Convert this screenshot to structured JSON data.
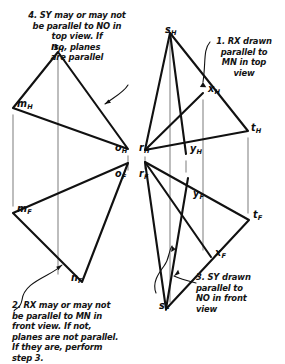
{
  "drawing": {
    "title": "Descriptive geometry construction: parallel planes MNO and RST",
    "ink_color": "#111111",
    "projection_line_color": "#9a9a9a",
    "background_color": "#ffffff"
  },
  "notes": [
    {
      "id": "note-1",
      "number": "1.",
      "text": "1. RX drawn\nparallel to\nMN in top\nview"
    },
    {
      "id": "note-2",
      "number": "2.",
      "text": "2. RX may or may not\n   be parallel to MN in\n   front view. If not,\n   planes are not parallel.\n   If they are, perform\n   step  3."
    },
    {
      "id": "note-3",
      "number": "3.",
      "text": "3. SY drawn\n    parallel to\n    NO in front\n    view"
    },
    {
      "id": "note-4",
      "number": "4.",
      "text": "4. SY may or may not\nbe parallel to NO in\ntop view. If\nso, planes\nare parallel"
    }
  ],
  "point_labels": [
    {
      "id": "m-h",
      "base": "m",
      "sub": "H",
      "x": 17,
      "y": 98
    },
    {
      "id": "n-h",
      "base": "n",
      "sub": "H",
      "x": 51,
      "y": 41
    },
    {
      "id": "o-h",
      "base": "o",
      "sub": "H",
      "x": 115,
      "y": 142
    },
    {
      "id": "r-h",
      "base": "r",
      "sub": "H",
      "x": 139,
      "y": 142
    },
    {
      "id": "s-h",
      "base": "s",
      "sub": "H",
      "x": 165,
      "y": 24
    },
    {
      "id": "x-h",
      "base": "x",
      "sub": "H",
      "x": 208,
      "y": 83
    },
    {
      "id": "y-h",
      "base": "y",
      "sub": "H",
      "x": 190,
      "y": 143
    },
    {
      "id": "t-h",
      "base": "t",
      "sub": "H",
      "x": 251,
      "y": 122
    },
    {
      "id": "m-f",
      "base": "m",
      "sub": "F",
      "x": 17,
      "y": 203
    },
    {
      "id": "n-f",
      "base": "n",
      "sub": "F",
      "x": 71,
      "y": 272
    },
    {
      "id": "o-f",
      "base": "o",
      "sub": "F",
      "x": 115,
      "y": 168
    },
    {
      "id": "r-f",
      "base": "r",
      "sub": "F",
      "x": 139,
      "y": 168
    },
    {
      "id": "s-f",
      "base": "s",
      "sub": "F",
      "x": 159,
      "y": 300
    },
    {
      "id": "x-f",
      "base": "x",
      "sub": "F",
      "x": 215,
      "y": 247
    },
    {
      "id": "y-f",
      "base": "y",
      "sub": "F",
      "x": 193,
      "y": 188
    },
    {
      "id": "t-f",
      "base": "t",
      "sub": "F",
      "x": 253,
      "y": 209
    }
  ],
  "geometry": {
    "points": {
      "m_H": [
        13,
        108
      ],
      "n_H": [
        58,
        52
      ],
      "o_H": [
        128,
        149
      ],
      "r_H": [
        145,
        150
      ],
      "s_H": [
        170,
        33
      ],
      "t_H": [
        248,
        131
      ],
      "x_H": [
        203,
        93
      ],
      "y_H": [
        186,
        154
      ],
      "m_F": [
        13,
        213
      ],
      "n_F": [
        82,
        282
      ],
      "o_F": [
        128,
        163
      ],
      "r_F": [
        145,
        162
      ],
      "s_F": [
        166,
        309
      ],
      "t_F": [
        249,
        220
      ],
      "x_F": [
        211,
        257
      ],
      "y_F": [
        188,
        178
      ]
    },
    "triangle_top_left": [
      "m_H",
      "n_H",
      "o_H"
    ],
    "triangle_front_left": [
      "m_F",
      "n_F",
      "o_F"
    ],
    "triangle_top_right": [
      "r_H",
      "s_H",
      "t_H"
    ],
    "triangle_front_right": [
      "r_F",
      "s_F",
      "t_F"
    ],
    "line_rx_top": [
      "r_H",
      "x_H"
    ],
    "line_rx_front": [
      "r_F",
      "x_F"
    ],
    "line_sy_top": [
      "s_H",
      "y_H"
    ],
    "line_sy_front": [
      "s_F",
      "y_F"
    ],
    "projection_lines": [
      [
        13,
        115,
        13,
        206
      ],
      [
        58,
        60,
        58,
        274
      ],
      [
        128,
        156,
        128,
        170
      ],
      [
        145,
        157,
        145,
        169
      ],
      [
        170,
        41,
        170,
        302
      ],
      [
        186,
        161,
        186,
        172
      ],
      [
        203,
        100,
        203,
        250
      ],
      [
        248,
        138,
        248,
        213
      ]
    ]
  }
}
